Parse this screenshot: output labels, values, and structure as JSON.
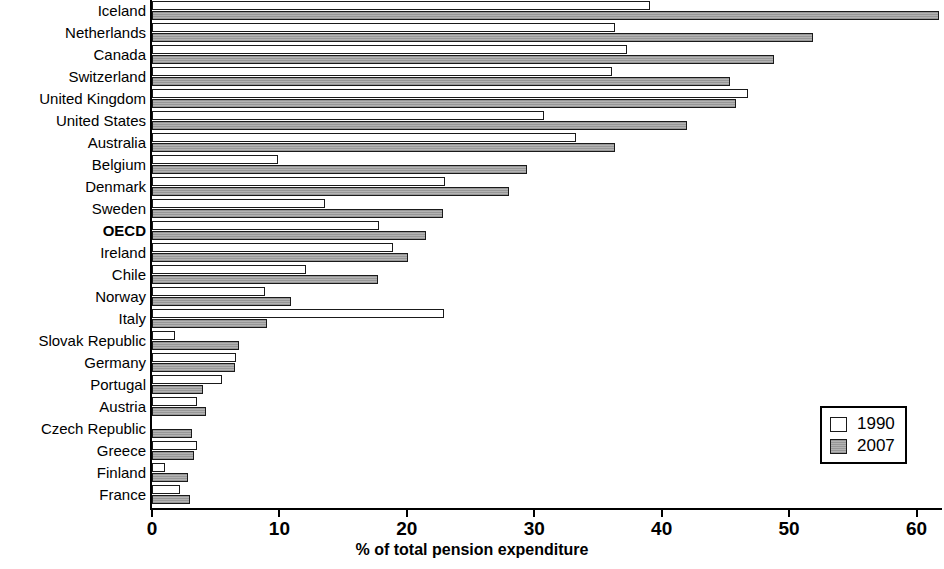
{
  "chart_data": {
    "type": "bar",
    "orientation": "horizontal",
    "title": "",
    "xlabel": "% of total pension expenditure",
    "ylabel": "",
    "xlim": [
      0,
      60
    ],
    "xticks": [
      0,
      10,
      20,
      30,
      40,
      50,
      60
    ],
    "grid": false,
    "legend_position": "bottom-right",
    "categories": [
      "Iceland",
      "Netherlands",
      "Canada",
      "Switzerland",
      "United Kingdom",
      "United States",
      "Australia",
      "Belgium",
      "Denmark",
      "Sweden",
      "OECD",
      "Ireland",
      "Chile",
      "Norway",
      "Italy",
      "Slovak Republic",
      "Germany",
      "Portugal",
      "Austria",
      "Czech Republic",
      "Greece",
      "Finland",
      "France"
    ],
    "emphasized_categories": [
      "OECD"
    ],
    "series": [
      {
        "name": "1990",
        "color": "#ffffff",
        "values": [
          39.1,
          36.3,
          37.3,
          36.1,
          46.8,
          30.8,
          33.3,
          9.9,
          23.0,
          13.6,
          17.8,
          18.9,
          12.1,
          8.9,
          22.9,
          1.8,
          6.6,
          5.5,
          3.5,
          0.0,
          3.5,
          1.0,
          2.2
        ]
      },
      {
        "name": "2007",
        "color": "#a8a8a8",
        "values": [
          61.8,
          51.9,
          48.8,
          45.4,
          45.8,
          42.0,
          36.3,
          29.4,
          28.0,
          22.8,
          21.5,
          20.1,
          17.7,
          10.9,
          9.0,
          6.8,
          6.5,
          4.0,
          4.2,
          3.1,
          3.3,
          2.8,
          3.0
        ]
      }
    ]
  },
  "legend": {
    "entries": [
      {
        "label": "1990",
        "swatch": "white-square"
      },
      {
        "label": "2007",
        "swatch": "gray-square"
      }
    ]
  }
}
